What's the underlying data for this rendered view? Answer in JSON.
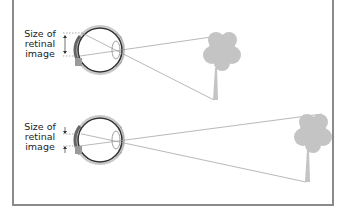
{
  "diagram": {
    "title": "",
    "colors": {
      "frame": "#8a8a8a",
      "tree": "#c4c4c4",
      "ray": "#9a9a9a",
      "eye_outline": "#333333",
      "retina": "#777777",
      "text": "#222222"
    },
    "panels": [
      {
        "id": "near",
        "label_lines": [
          "Size of",
          "retinal",
          "image"
        ],
        "description": "Tree close to the eye produces a larger retinal image"
      },
      {
        "id": "far",
        "label_lines": [
          "Size of",
          "retinal",
          "image"
        ],
        "description": "Tree farther away produces a smaller retinal image"
      }
    ]
  }
}
